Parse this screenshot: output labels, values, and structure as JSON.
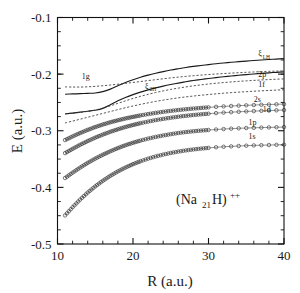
{
  "chart_data": {
    "type": "line",
    "title": "",
    "annotation": "(Na21H)++",
    "annotation_parts": {
      "open": "(Na",
      "sub": "21",
      "mid": "H)",
      "sup": "++"
    },
    "xlabel": "R (a.u.)",
    "ylabel": "E (a.u.)",
    "xlim": [
      10,
      40
    ],
    "ylim": [
      -0.5,
      -0.1
    ],
    "xticks": [
      10,
      20,
      30,
      40
    ],
    "xtick_labels": [
      "10",
      "20",
      "30",
      "40"
    ],
    "xminor_step": 2,
    "yticks": [
      -0.1,
      -0.2,
      -0.3,
      -0.4,
      -0.5
    ],
    "ytick_labels": [
      "-0.1",
      "-0.2",
      "-0.3",
      "-0.4",
      "-0.5"
    ],
    "yminor_step": 0.025,
    "grid": false,
    "legend": "inline-labels",
    "x": [
      11,
      12,
      13,
      14,
      15,
      16,
      17,
      18,
      19,
      20,
      21,
      22,
      23,
      24,
      25,
      26,
      27,
      28,
      29,
      30,
      31,
      32,
      33,
      34,
      35,
      36,
      37,
      38,
      39,
      40
    ],
    "series": [
      {
        "name": "xi_LH",
        "label": "ξ",
        "label_sub": "LH",
        "style": "solid",
        "marker": "none",
        "label_x": 36.6,
        "label_y": -0.168,
        "values": [
          -0.2355,
          -0.235,
          -0.2345,
          -0.234,
          -0.2333,
          -0.231,
          -0.2265,
          -0.2205,
          -0.2148,
          -0.2098,
          -0.2055,
          -0.2018,
          -0.1985,
          -0.1955,
          -0.1928,
          -0.1905,
          -0.1883,
          -0.1864,
          -0.1847,
          -0.1831,
          -0.1816,
          -0.1803,
          -0.1791,
          -0.178,
          -0.177,
          -0.176,
          -0.1751,
          -0.1742,
          -0.1734,
          -0.1727
        ]
      },
      {
        "name": "xi_2H",
        "label": "ξ",
        "label_sub": "2H",
        "style": "solid",
        "marker": "none",
        "label_x": 21.6,
        "label_y": -0.2255,
        "values": [
          -0.2705,
          -0.2688,
          -0.2672,
          -0.2655,
          -0.2638,
          -0.2605,
          -0.254,
          -0.247,
          -0.2412,
          -0.2362,
          -0.2318,
          -0.2278,
          -0.2243,
          -0.2212,
          -0.2184,
          -0.2158,
          -0.2134,
          -0.2113,
          -0.2094,
          -0.2077,
          -0.2061,
          -0.2046,
          -0.2033,
          -0.202,
          -0.2008,
          -0.1997,
          -0.1987,
          -0.1977,
          -0.1968,
          -0.196
        ]
      },
      {
        "name": "1g",
        "label": "1g",
        "label_sub": "",
        "style": "dashed",
        "marker": "none",
        "label_x": 13.2,
        "label_y": -0.2085,
        "values": [
          -0.2225,
          -0.2228,
          -0.2228,
          -0.2224,
          -0.2216,
          -0.2205,
          -0.2192,
          -0.2178,
          -0.2163,
          -0.2147,
          -0.2131,
          -0.2114,
          -0.2098,
          -0.2082,
          -0.2067,
          -0.2053,
          -0.204,
          -0.2028,
          -0.2017,
          -0.2007,
          -0.1998,
          -0.199,
          -0.1982,
          -0.1975,
          -0.1968,
          -0.1962,
          -0.1956,
          -0.1951,
          -0.1946,
          -0.1941
        ]
      },
      {
        "name": "2p",
        "label": "2p",
        "label_sub": "",
        "style": "dashed",
        "marker": "none",
        "label_x": 36.6,
        "label_y": -0.2055,
        "values": [
          -0.27,
          -0.269,
          -0.2676,
          -0.2658,
          -0.2634,
          -0.26,
          -0.256,
          -0.2516,
          -0.2472,
          -0.243,
          -0.2392,
          -0.2357,
          -0.2325,
          -0.2296,
          -0.227,
          -0.2247,
          -0.2226,
          -0.2207,
          -0.219,
          -0.2175,
          -0.2161,
          -0.2149,
          -0.2138,
          -0.2128,
          -0.2119,
          -0.2111,
          -0.2103,
          -0.2096,
          -0.209,
          -0.2084
        ]
      },
      {
        "name": "1f",
        "label": "1f",
        "label_sub": "",
        "style": "dashed",
        "marker": "none",
        "label_x": 36.6,
        "label_y": -0.2225,
        "values": [
          -0.2862,
          -0.283,
          -0.2796,
          -0.2762,
          -0.2728,
          -0.2694,
          -0.266,
          -0.2626,
          -0.2594,
          -0.2563,
          -0.2534,
          -0.2507,
          -0.2482,
          -0.2459,
          -0.2438,
          -0.2419,
          -0.2402,
          -0.2387,
          -0.2373,
          -0.236,
          -0.2348,
          -0.2337,
          -0.2327,
          -0.2318,
          -0.231,
          -0.2302,
          -0.2295,
          -0.2288,
          -0.2282,
          -0.2276
        ]
      },
      {
        "name": "2s",
        "label": "2s",
        "label_sub": "",
        "style": "marker",
        "marker": "circle",
        "label_x": 36.0,
        "label_y": -0.2485,
        "values": [
          -0.3165,
          -0.31,
          -0.304,
          -0.2985,
          -0.2935,
          -0.289,
          -0.285,
          -0.2815,
          -0.2783,
          -0.2755,
          -0.2729,
          -0.2706,
          -0.2685,
          -0.2666,
          -0.2649,
          -0.2634,
          -0.262,
          -0.2608,
          -0.2597,
          -0.2587,
          -0.2578,
          -0.257,
          -0.2563,
          -0.2557,
          -0.2551,
          -0.2546,
          -0.2541,
          -0.2537,
          -0.2533,
          -0.253
        ]
      },
      {
        "name": "1d",
        "label": "1d",
        "label_sub": "",
        "style": "marker",
        "marker": "circle",
        "label_x": 37.2,
        "label_y": -0.2665,
        "values": [
          -0.3395,
          -0.332,
          -0.3248,
          -0.3182,
          -0.3122,
          -0.3068,
          -0.3018,
          -0.2974,
          -0.2934,
          -0.2898,
          -0.2866,
          -0.2838,
          -0.2812,
          -0.279,
          -0.277,
          -0.2752,
          -0.2736,
          -0.2722,
          -0.271,
          -0.2699,
          -0.2689,
          -0.268,
          -0.2672,
          -0.2665,
          -0.2659,
          -0.2653,
          -0.2648,
          -0.2643,
          -0.2639,
          -0.2635
        ]
      },
      {
        "name": "1p",
        "label": "1p",
        "label_sub": "",
        "style": "marker",
        "marker": "circle",
        "label_x": 35.3,
        "label_y": -0.2905,
        "values": [
          -0.3835,
          -0.374,
          -0.365,
          -0.3568,
          -0.3492,
          -0.3424,
          -0.3362,
          -0.3306,
          -0.3256,
          -0.3212,
          -0.3173,
          -0.3139,
          -0.3109,
          -0.3083,
          -0.306,
          -0.304,
          -0.3023,
          -0.3009,
          -0.2997,
          -0.2987,
          -0.2978,
          -0.297,
          -0.2963,
          -0.2957,
          -0.2952,
          -0.2948,
          -0.2944,
          -0.2941,
          -0.2938,
          -0.2935
        ]
      },
      {
        "name": "1s",
        "label": "1s",
        "label_sub": "",
        "style": "marker",
        "marker": "circle",
        "label_x": 35.3,
        "label_y": -0.315,
        "values": [
          -0.4495,
          -0.435,
          -0.4215,
          -0.4092,
          -0.3982,
          -0.3884,
          -0.3796,
          -0.3718,
          -0.365,
          -0.359,
          -0.3538,
          -0.3493,
          -0.3454,
          -0.3421,
          -0.3392,
          -0.3368,
          -0.3347,
          -0.333,
          -0.3315,
          -0.3303,
          -0.3292,
          -0.3283,
          -0.3276,
          -0.3269,
          -0.3264,
          -0.3259,
          -0.3255,
          -0.3252,
          -0.3249,
          -0.3246
        ]
      }
    ]
  }
}
